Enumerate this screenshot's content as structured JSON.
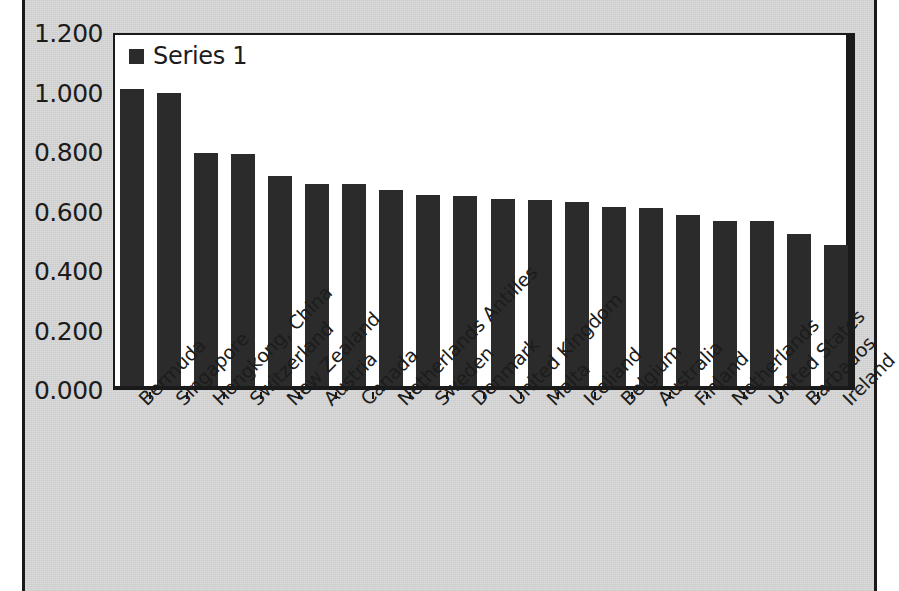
{
  "chart_data": {
    "type": "bar",
    "title": "",
    "xlabel": "",
    "ylabel": "",
    "ylim": [
      0.0,
      1.2
    ],
    "y_ticks": [
      "0.000",
      "0.200",
      "0.400",
      "0.600",
      "0.800",
      "1.000",
      "1.200"
    ],
    "y_tick_values": [
      0.0,
      0.2,
      0.4,
      0.6,
      0.8,
      1.0,
      1.2
    ],
    "grid": false,
    "legend_position": "top-left",
    "legend": [
      "Series 1"
    ],
    "categories": [
      "Bermuda",
      "Singapore",
      "Hongkong, China",
      "Switzerland",
      "New Zealand",
      "Austria",
      "Canada",
      "Netherlands Antilles",
      "Sweden",
      "Denmark",
      "United Kingdom",
      "Malta",
      "Iceliand",
      "Belgium",
      "Australia",
      "Finland",
      "Netherlands",
      "United States",
      "Barbados",
      "Ireland"
    ],
    "series": [
      {
        "name": "Series 1",
        "color": "#2b2b2b",
        "values": [
          1.0,
          0.985,
          0.783,
          0.78,
          0.707,
          0.68,
          0.68,
          0.66,
          0.642,
          0.64,
          0.63,
          0.625,
          0.62,
          0.603,
          0.598,
          0.575,
          0.553,
          0.553,
          0.51,
          0.475
        ]
      }
    ]
  },
  "legend": {
    "label": "Series 1",
    "swatch_color": "#2b2b2b"
  },
  "colors": {
    "bar": "#2b2b2b",
    "plot_background": "#ffffff",
    "chart_background": "#d9d9d9",
    "axis": "#1a1a1a",
    "text": "#1c1c1c"
  }
}
